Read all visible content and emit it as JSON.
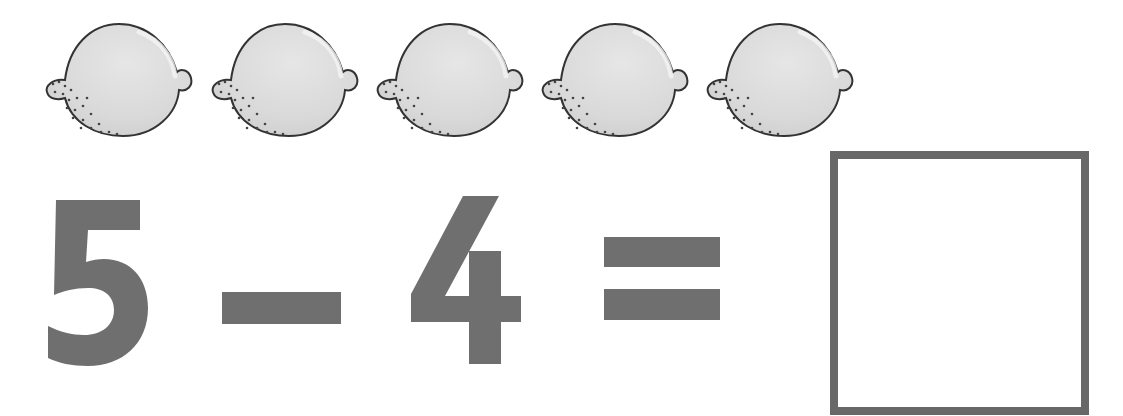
{
  "worksheet": {
    "type": "subtraction-exercise",
    "objects": {
      "name": "lemon",
      "icon": "lemon-icon",
      "count": 5,
      "positions_x": [
        45,
        211,
        376,
        541,
        706
      ]
    },
    "equation": {
      "minuend": "5",
      "operator": "−",
      "subtrahend": "4",
      "equals": "=",
      "answer": ""
    },
    "colors": {
      "glyph": "#6f6f6f",
      "box_border": "#686868",
      "lemon_fill": "#dcdcdc",
      "lemon_outline": "#333333"
    }
  }
}
